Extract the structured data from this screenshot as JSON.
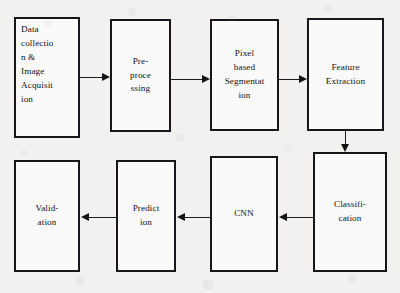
{
  "diagram": {
    "background_color": "#f2f1ef",
    "box_border_color": "#17161a",
    "box_fill_color": "#fbfafa",
    "arrow_color": "#141317",
    "nodes": [
      {
        "id": "data-collection",
        "label": "Data\ncollectio\nn &\nImage\nAcquisit\nion",
        "align": "left"
      },
      {
        "id": "pre-processing",
        "label": "Pre-\nproce\nssing",
        "align": "center"
      },
      {
        "id": "pixel-based-segmentation",
        "label": "Pixel\nbased\nSegmentat\nion",
        "align": "center"
      },
      {
        "id": "feature-extraction",
        "label": "Feature\nExtraction",
        "align": "center"
      },
      {
        "id": "classification",
        "label": "Classifi-\ncation",
        "align": "center"
      },
      {
        "id": "cnn",
        "label": "CNN",
        "align": "center"
      },
      {
        "id": "prediction",
        "label": "Predict\nion",
        "align": "center"
      },
      {
        "id": "validation",
        "label": "Valid-\nation",
        "align": "center"
      }
    ],
    "edges": [
      {
        "id": "edge-data-to-pre",
        "from": "data-collection",
        "to": "pre-processing",
        "direction": "right"
      },
      {
        "id": "edge-pre-to-segmentation",
        "from": "pre-processing",
        "to": "pixel-based-segmentation",
        "direction": "right"
      },
      {
        "id": "edge-segmentation-to-feature",
        "from": "pixel-based-segmentation",
        "to": "feature-extraction",
        "direction": "right"
      },
      {
        "id": "edge-feature-to-classification",
        "from": "feature-extraction",
        "to": "classification",
        "direction": "down"
      },
      {
        "id": "edge-classification-to-cnn",
        "from": "classification",
        "to": "cnn",
        "direction": "left"
      },
      {
        "id": "edge-cnn-to-prediction",
        "from": "cnn",
        "to": "prediction",
        "direction": "left"
      },
      {
        "id": "edge-prediction-to-validation",
        "from": "prediction",
        "to": "validation",
        "direction": "left"
      }
    ]
  }
}
